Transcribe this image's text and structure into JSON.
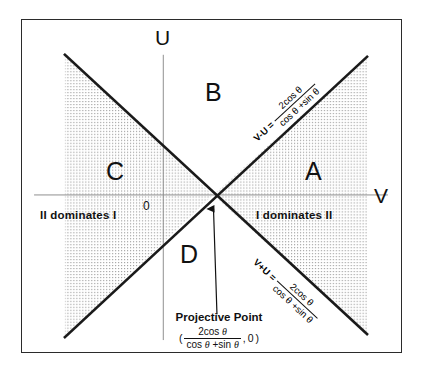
{
  "figure": {
    "type": "region-partition-diagram",
    "background_color": "#ffffff",
    "border_color": "#2b2b2b",
    "line_color": "#1a1a1a",
    "hatch_color": "#9a9a9a",
    "axes": {
      "vertical_label": "U",
      "horizontal_label": "V",
      "origin_label": "0"
    },
    "regions": [
      {
        "key": "A",
        "label": "A",
        "shaded": true
      },
      {
        "key": "B",
        "label": "B",
        "shaded": false
      },
      {
        "key": "C",
        "label": "C",
        "shaded": true
      },
      {
        "key": "D",
        "label": "D",
        "shaded": false
      }
    ],
    "dominance": {
      "left": "II dominates I",
      "right": "I dominates II"
    },
    "annotation": {
      "title": "Projective Point",
      "open_paren": "(",
      "numerator": "2cos",
      "theta": "θ",
      "denominator_first": "cos",
      "denominator_plus": "+sin",
      "comma": ",",
      "second_coord": "0",
      "close_paren": ")"
    },
    "equations": [
      {
        "id": "upper-diagonal",
        "lhs": "V-U  =",
        "numerator": "2cos θ",
        "denominator": "cos θ +sin θ"
      },
      {
        "id": "lower-diagonal",
        "lhs": "V+U  =",
        "numerator": "2cos θ",
        "denominator": "cos θ +sin θ"
      }
    ]
  }
}
